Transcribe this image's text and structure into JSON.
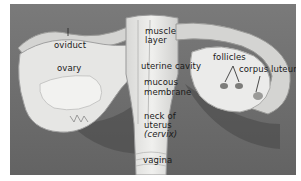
{
  "figure": {
    "labels": {
      "oviduct": "oviduct",
      "ovary": "ovary",
      "muscle_layer_1": "muscle",
      "muscle_layer_2": "layer",
      "uterine_cavity": "uterine cavity",
      "mucous_membrane_1": "mucous",
      "mucous_membrane_2": "membrane",
      "neck_1": "neck of",
      "neck_2": "uterus",
      "neck_3": "(cervix)",
      "vagina": "vagina",
      "follicles": "follicles",
      "corpus_luteum": "corpus luteum"
    },
    "colors": {
      "background": "#6e6e6e",
      "tissue_light": "#e8e8e6",
      "tissue_mid": "#c9c9c7",
      "shadow": "#3a3a3a",
      "label_text": "#1a1a1a"
    }
  }
}
